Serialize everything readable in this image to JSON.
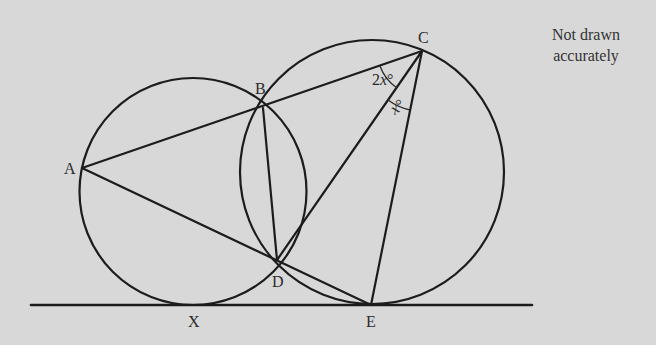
{
  "diagram": {
    "note": "Not drawn accurately",
    "note_lines": [
      "Not drawn",
      "accurately"
    ],
    "colors": {
      "background": "#d8d8d8",
      "stroke": "#1c1c1c",
      "text": "#2a2a2a"
    },
    "points": {
      "A": {
        "label": "A",
        "x": 82,
        "y": 168
      },
      "B": {
        "label": "B",
        "x": 263,
        "y": 108
      },
      "C": {
        "label": "C",
        "x": 422,
        "y": 51
      },
      "D": {
        "label": "D",
        "x": 277,
        "y": 260
      },
      "E": {
        "label": "E",
        "x": 371,
        "y": 305
      },
      "X": {
        "label": "X",
        "x": 193,
        "y": 305
      }
    },
    "circles": [
      {
        "name": "circle-ABDX",
        "cx": 193,
        "cy": 191.5,
        "r": 113.5,
        "through": [
          "A",
          "B",
          "D",
          "X"
        ]
      },
      {
        "name": "circle-BCED",
        "cx": 372,
        "cy": 172,
        "r": 132,
        "through": [
          "B",
          "C",
          "E",
          "D"
        ]
      }
    ],
    "tangent_line": {
      "x1": 31,
      "x2": 532,
      "y": 305,
      "touches": [
        "X",
        "E"
      ]
    },
    "segments": [
      [
        "A",
        "B"
      ],
      [
        "B",
        "C"
      ],
      [
        "A",
        "D"
      ],
      [
        "D",
        "E"
      ],
      [
        "A",
        "E"
      ],
      [
        "B",
        "D"
      ],
      [
        "C",
        "D"
      ],
      [
        "C",
        "E"
      ]
    ],
    "angles": [
      {
        "vertex": "C",
        "between": [
          "B",
          "D"
        ],
        "label": "2x°",
        "label_main": "2",
        "label_var": "x",
        "label_deg": "°"
      },
      {
        "vertex": "C",
        "between": [
          "D",
          "E"
        ],
        "label": "x°",
        "label_main": "",
        "label_var": "x",
        "label_deg": "°"
      }
    ]
  }
}
